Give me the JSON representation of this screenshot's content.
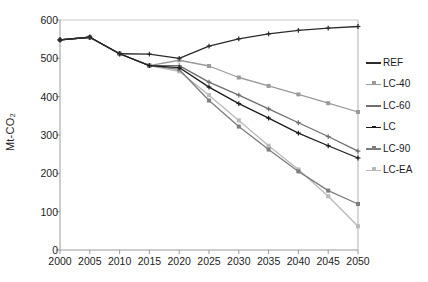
{
  "chart_data": {
    "type": "line",
    "title": "",
    "xlabel": "",
    "ylabel": "Mt-CO₂",
    "x": [
      2000,
      2005,
      2010,
      2015,
      2020,
      2025,
      2030,
      2035,
      2040,
      2045,
      2050
    ],
    "xlim": [
      2000,
      2050
    ],
    "ylim": [
      0,
      600
    ],
    "ytick_labels": [
      "0",
      "100",
      "200",
      "300",
      "400",
      "500",
      "600"
    ],
    "yticks": [
      0,
      100,
      200,
      300,
      400,
      500,
      600
    ],
    "xtick_labels": [
      "2000",
      "2005",
      "2010",
      "2015",
      "2020",
      "2025",
      "2030",
      "2035",
      "2040",
      "2045",
      "2050"
    ],
    "grid": false,
    "legend_position": "right",
    "series": [
      {
        "name": "REF",
        "color": "#2b2b2b",
        "values": [
          548,
          555,
          512,
          511,
          500,
          532,
          551,
          564,
          573,
          579,
          583
        ]
      },
      {
        "name": "LC-40",
        "color": "#9a9a9a",
        "values": [
          548,
          555,
          512,
          481,
          495,
          480,
          450,
          428,
          406,
          383,
          360
        ]
      },
      {
        "name": "LC-60",
        "color": "#6e6e6e",
        "values": [
          548,
          555,
          512,
          481,
          481,
          438,
          404,
          368,
          332,
          296,
          258
        ]
      },
      {
        "name": "LC",
        "color": "#1c1c1c",
        "values": [
          548,
          555,
          512,
          481,
          476,
          425,
          382,
          344,
          305,
          272,
          240
        ]
      },
      {
        "name": "LC-90",
        "color": "#7d7d7d",
        "values": [
          548,
          555,
          512,
          481,
          471,
          390,
          322,
          262,
          205,
          155,
          120
        ]
      },
      {
        "name": "LC-EA",
        "color": "#b9b9b9",
        "values": [
          548,
          555,
          512,
          481,
          466,
          404,
          338,
          272,
          210,
          140,
          62
        ]
      }
    ]
  },
  "legend": {
    "items": [
      {
        "label": "REF"
      },
      {
        "label": "LC-40"
      },
      {
        "label": "LC-60"
      },
      {
        "label": "LC"
      },
      {
        "label": "LC-90"
      },
      {
        "label": "LC-EA"
      }
    ]
  }
}
